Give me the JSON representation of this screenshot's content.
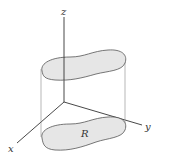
{
  "diagram": {
    "type": "3d-cylinder-region",
    "axes": {
      "z_label": "z",
      "y_label": "y",
      "x_label": "x"
    },
    "region_label": "R",
    "colors": {
      "fill": "#e6e6e6",
      "stroke": "#555555",
      "axis": "#333333",
      "guide": "#777777"
    }
  }
}
